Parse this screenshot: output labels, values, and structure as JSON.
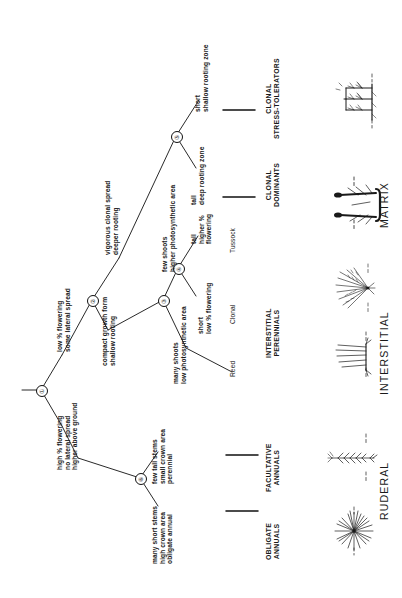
{
  "diagram": {
    "orientation": "rotated-90-ccw"
  },
  "nodes": [
    {
      "id": "1",
      "glyph": "①"
    },
    {
      "id": "2",
      "glyph": "②"
    },
    {
      "id": "3",
      "glyph": "③"
    },
    {
      "id": "4",
      "glyph": "④"
    },
    {
      "id": "5",
      "glyph": "⑤"
    },
    {
      "id": "6",
      "glyph": "⑥"
    }
  ],
  "branch_labels": {
    "low_flowering": "low % flowering\nsome lateral spread",
    "high_flowering": "high % flowering\nno lateral spread\nhigher above ground",
    "vigorous_clonal": "vigorous clonal spread\ndeeper rooting",
    "compact_growth": "compact growth form\nshallow rooting",
    "many_shoots": "many shoots\nlow photosynthetic area",
    "few_shoots": "few shoots\nhigher photosynthetic area",
    "short_low_flowering": "short\nlow % flowering",
    "tall_higher_flowering": "tall\nhigher %\nflowering",
    "tall_deep_rooting": "tall\ndeep rooting zone",
    "short_shallow_rooting": "short\nshallow rooting zone",
    "many_short_stems": "many short stems\nhigh crown area\nobligate annual",
    "few_tall_stems": "few tall stems\nsmall crown area\nperennial"
  },
  "terminal_types": {
    "reed": "Reed",
    "clonal": "Clonal",
    "tussock": "Tussock"
  },
  "categories": [
    {
      "key": "obligate_annuals",
      "label": "OBLIGATE\nANNUALS"
    },
    {
      "key": "facultative_annuals",
      "label": "FACULTATIVE\nANNUALS"
    },
    {
      "key": "interstitial_perennials",
      "label": "INTERSTITIAL\nPERENNIALS"
    },
    {
      "key": "clonal_dominants",
      "label": "CLONAL\nDOMINANTS"
    },
    {
      "key": "clonal_stress_tolerators",
      "label": "CLONAL\nSTRESS-TOLERATORS"
    }
  ],
  "groups": [
    {
      "key": "ruderal",
      "label": "RUDERAL"
    },
    {
      "key": "interstitial",
      "label": "INTERSTITIAL"
    },
    {
      "key": "matrix",
      "label": "MATRIX"
    }
  ],
  "sketches": {
    "obligate_annual_rosette": "rosette-plant-sketch",
    "facultative_annual_stem": "tall-stem-plant-sketch",
    "reed_shoots": "reed-shoots-sketch",
    "tussock_fan": "tussock-fan-sketch",
    "clonal_dominant_tall": "clonal-dominant-sketch",
    "clonal_rhizome": "clonal-rhizome-sketch",
    "clonal_stress_tolerator": "clonal-stress-tolerator-sketch"
  },
  "colors": {
    "ink": "#1a1a1a",
    "line": "#111111",
    "background": "#ffffff"
  }
}
